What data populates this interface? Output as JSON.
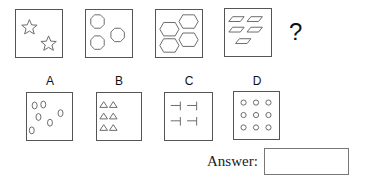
{
  "puzzle": {
    "sequence": [
      {
        "shape": "star",
        "count": 2
      },
      {
        "shape": "octagon",
        "count": 3
      },
      {
        "shape": "hexagon",
        "count": 4
      },
      {
        "shape": "parallelogram",
        "count": 5
      }
    ],
    "question_mark": "?"
  },
  "options": [
    {
      "label": "A",
      "shape": "ellipse",
      "count": 7
    },
    {
      "label": "B",
      "shape": "triangle",
      "count": 6
    },
    {
      "label": "C",
      "shape": "t-bar",
      "count": 4
    },
    {
      "label": "D",
      "shape": "circle",
      "count": 9
    }
  ],
  "answer": {
    "label": "Answer:",
    "value": ""
  }
}
